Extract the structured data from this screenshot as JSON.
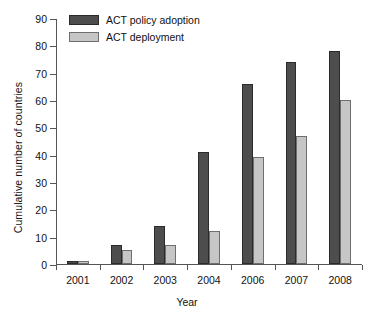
{
  "chart_data": {
    "type": "bar",
    "title": "",
    "xlabel": "Year",
    "ylabel": "Cumulative number of countries",
    "categories": [
      "2001",
      "2002",
      "2003",
      "2004",
      "2006",
      "2007",
      "2008"
    ],
    "series": [
      {
        "name": "ACT policy adoption",
        "color": "#4d4d4d",
        "values": [
          1,
          7,
          14,
          41,
          66,
          74,
          78
        ]
      },
      {
        "name": "ACT deployment",
        "color": "#c6c6c6",
        "values": [
          1,
          5,
          7,
          12,
          39,
          47,
          60
        ]
      }
    ],
    "ylim": [
      0,
      90
    ],
    "yticks": [
      0,
      10,
      20,
      30,
      40,
      50,
      60,
      70,
      80,
      90
    ],
    "ytick_labels": [
      "0",
      "10",
      "20",
      "30",
      "40",
      "50",
      "60",
      "70",
      "80",
      "90"
    ],
    "grid": false,
    "legend_position": "top-left-inside"
  }
}
